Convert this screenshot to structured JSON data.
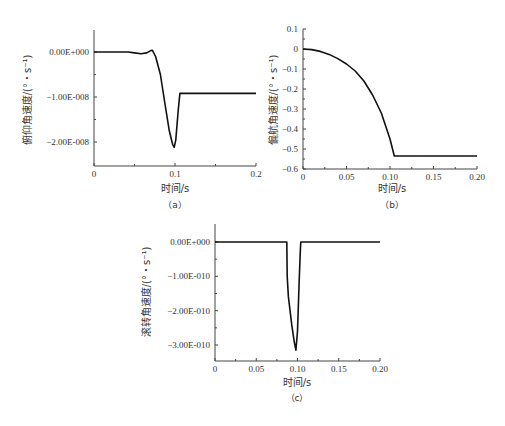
{
  "chart_data": [
    {
      "id": "a",
      "type": "line",
      "caption": "（a）",
      "title": "",
      "xlabel": "时间/s",
      "ylabel": "俯仰角速度/(°・s⁻¹)",
      "xlim": [
        0,
        0.2
      ],
      "ylim": [
        -2.5e-08,
        5e-09
      ],
      "xticks": [
        0,
        0.1,
        0.2
      ],
      "xtick_labels": [
        "0",
        "0.1",
        "0.2"
      ],
      "yticks": [
        0,
        -1e-08,
        -2e-08
      ],
      "ytick_labels": [
        "0.00E+000",
        "-1.00E-008",
        "-2.00E-008"
      ],
      "grid": false,
      "series": [
        {
          "name": "pitch rate",
          "x": [
            0,
            0.02,
            0.042,
            0.05,
            0.058,
            0.065,
            0.07,
            0.072,
            0.076,
            0.082,
            0.088,
            0.093,
            0.097,
            0.099,
            0.101,
            0.104,
            0.106,
            0.15,
            0.2
          ],
          "y": [
            0,
            0,
            0,
            -2e-10,
            -4e-10,
            -2e-10,
            3e-10,
            4e-10,
            -1e-09,
            -5e-09,
            -1.2e-08,
            -1.75e-08,
            -2.05e-08,
            -2.12e-08,
            -1.95e-08,
            -1.3e-08,
            -9.2e-09,
            -9.2e-09,
            -9.2e-09
          ]
        }
      ]
    },
    {
      "id": "b",
      "type": "line",
      "caption": "（b）",
      "title": "",
      "xlabel": "时间/s",
      "ylabel": "偏航角速度/(°・s⁻¹)",
      "xlim": [
        0,
        0.2
      ],
      "ylim": [
        -0.6,
        0.1
      ],
      "xticks": [
        0,
        0.05,
        0.1,
        0.15,
        0.2
      ],
      "xtick_labels": [
        "0",
        "0.05",
        "0.10",
        "0.15",
        "0.20"
      ],
      "yticks": [
        0.1,
        0,
        -0.1,
        -0.2,
        -0.3,
        -0.4,
        -0.5,
        -0.6
      ],
      "ytick_labels": [
        "0.1",
        "0",
        "-0.1",
        "-0.2",
        "-0.3",
        "-0.4",
        "-0.5",
        "-0.6"
      ],
      "grid": false,
      "series": [
        {
          "name": "yaw rate",
          "x": [
            0,
            0.01,
            0.02,
            0.03,
            0.04,
            0.05,
            0.06,
            0.07,
            0.08,
            0.09,
            0.1,
            0.105,
            0.15,
            0.2
          ],
          "y": [
            0,
            -0.003,
            -0.012,
            -0.027,
            -0.048,
            -0.075,
            -0.11,
            -0.16,
            -0.23,
            -0.32,
            -0.45,
            -0.535,
            -0.535,
            -0.535
          ]
        }
      ]
    },
    {
      "id": "c",
      "type": "line",
      "caption": "（c）",
      "title": "",
      "xlabel": "时间/s",
      "ylabel": "滚转角速度/(°・s⁻¹)",
      "xlim": [
        0,
        0.2
      ],
      "ylim": [
        -3.5e-10,
        5e-11
      ],
      "xticks": [
        0,
        0.05,
        0.1,
        0.15,
        0.2
      ],
      "xtick_labels": [
        "0",
        "0.05",
        "0.10",
        "0.15",
        "0.20"
      ],
      "yticks": [
        0,
        -1e-10,
        -2e-10,
        -3e-10
      ],
      "ytick_labels": [
        "0.00E+000",
        "-1.00E-010",
        "-2.00E-010",
        "-3.00E-010"
      ],
      "grid": false,
      "series": [
        {
          "name": "roll rate",
          "x": [
            0,
            0.087,
            0.0875,
            0.089,
            0.093,
            0.096,
            0.098,
            0.1,
            0.102,
            0.1035,
            0.104,
            0.15,
            0.2
          ],
          "y": [
            0,
            0,
            -1e-10,
            -1.6e-10,
            -2.4e-10,
            -2.9e-10,
            -3.15e-10,
            -2.6e-10,
            -1.2e-10,
            -2e-11,
            0,
            0,
            0
          ]
        }
      ]
    }
  ]
}
